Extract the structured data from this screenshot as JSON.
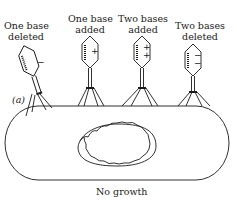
{
  "diagram": {
    "panel_label": "(a)",
    "phages": [
      {
        "line1": "One base",
        "line2": "deleted",
        "mutation_signs": "−"
      },
      {
        "line1": "One base",
        "line2": "added",
        "mutation_signs": "+"
      },
      {
        "line1": "Two bases",
        "line2": "added",
        "mutation_signs": "+\n+"
      },
      {
        "line1": "Two bases",
        "line2": "deleted",
        "mutation_signs": "−\n−"
      }
    ],
    "cell_caption": "No growth"
  }
}
